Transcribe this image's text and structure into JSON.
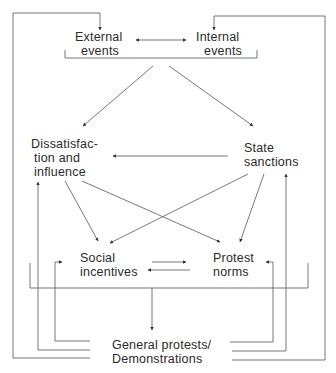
{
  "diagram": {
    "nodes": {
      "external_events": {
        "line1": "External",
        "line2": "events"
      },
      "internal_events": {
        "line1": "Internal",
        "line2": "events"
      },
      "dissatisfaction": {
        "line1": "Dissatisfac-",
        "line2": "tion and",
        "line3": "influence"
      },
      "state_sanctions": {
        "line1": "State",
        "line2": "sanctions"
      },
      "social_incentives": {
        "line1": "Social",
        "line2": "incentives"
      },
      "protest_norms": {
        "line1": "Protest",
        "line2": "norms"
      },
      "general_protests": {
        "line1": "General protests/",
        "line2": "Demonstrations"
      }
    },
    "edges": [
      {
        "from": "External events",
        "to": "Internal events",
        "type": "bidirectional"
      },
      {
        "from": "External+Internal events",
        "to": "Dissatisfaction and influence"
      },
      {
        "from": "External+Internal events",
        "to": "State sanctions"
      },
      {
        "from": "State sanctions",
        "to": "Dissatisfaction and influence"
      },
      {
        "from": "Dissatisfaction and influence",
        "to": "Social incentives"
      },
      {
        "from": "Dissatisfaction and influence",
        "to": "Protest norms"
      },
      {
        "from": "State sanctions",
        "to": "Social incentives"
      },
      {
        "from": "State sanctions",
        "to": "Protest norms"
      },
      {
        "from": "Social incentives",
        "to": "Protest norms",
        "type": "bidirectional"
      },
      {
        "from": "Social incentives+Protest norms",
        "to": "General protests/Demonstrations"
      },
      {
        "from": "General protests/Demonstrations",
        "to": "External events"
      },
      {
        "from": "General protests/Demonstrations",
        "to": "Internal events"
      },
      {
        "from": "General protests/Demonstrations",
        "to": "Dissatisfaction and influence"
      },
      {
        "from": "General protests/Demonstrations",
        "to": "State sanctions"
      },
      {
        "from": "General protests/Demonstrations",
        "to": "Social incentives"
      },
      {
        "from": "General protests/Demonstrations",
        "to": "Protest norms"
      }
    ],
    "colors": {
      "line": "#555555",
      "text": "#2a2a2a"
    }
  }
}
